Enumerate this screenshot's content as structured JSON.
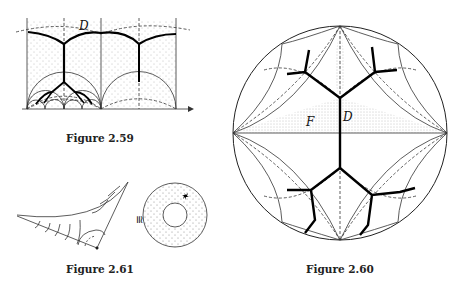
{
  "figures": [
    {
      "id": "fig-2-59",
      "caption": "Figure 2.59",
      "labels": {
        "region": "D"
      }
    },
    {
      "id": "fig-2-60",
      "caption": "Figure 2.60",
      "labels": {
        "region_d": "D",
        "region_f": "F"
      }
    },
    {
      "id": "fig-2-61",
      "caption": "Figure 2.61",
      "labels": {
        "isomorphic": "≅"
      }
    }
  ]
}
